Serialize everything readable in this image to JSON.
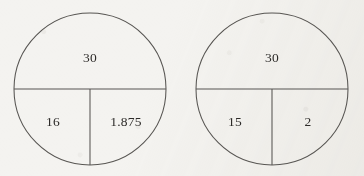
{
  "figure": {
    "background_color": "#f4f3f0",
    "stroke_color": "#575552",
    "text_color": "#2d2b29",
    "circles": [
      {
        "name": "left-circle",
        "top_value": "30",
        "bottom_left_value": "16",
        "bottom_right_value": "1.875"
      },
      {
        "name": "right-circle",
        "top_value": "30",
        "bottom_left_value": "15",
        "bottom_right_value": "2"
      }
    ]
  }
}
